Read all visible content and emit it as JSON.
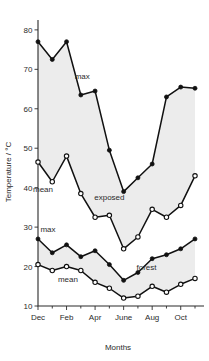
{
  "chart_data": {
    "type": "line",
    "title": "",
    "xlabel": "Months",
    "ylabel": "Temperature / °C",
    "ylim": [
      10,
      82
    ],
    "yticks": [
      10,
      20,
      30,
      40,
      50,
      60,
      70,
      80
    ],
    "ytick_labels": [
      "10",
      "20",
      "30",
      "40",
      "50",
      "60",
      "70",
      "80"
    ],
    "x": [
      "Dec",
      "Jan",
      "Feb",
      "Mar",
      "Apr",
      "May",
      "June",
      "July",
      "Aug",
      "Sep",
      "Oct",
      "Nov"
    ],
    "xticks": [
      "Dec",
      "Feb",
      "Apr",
      "June",
      "Aug",
      "Oct"
    ],
    "xtick_labels": [
      "Dec",
      "Feb",
      "Apr",
      "June",
      "Aug",
      "Oct"
    ],
    "grid": false,
    "legend_position": "inline-annotations",
    "annotations": [
      {
        "text": "max",
        "series": "exposed_max",
        "x": 3.1,
        "y": 67.5
      },
      {
        "text": "mean",
        "series": "exposed_mean",
        "x": 0.35,
        "y": 39.0
      },
      {
        "text": "exposed",
        "series": "exposed_band",
        "x": 5.0,
        "y": 37.0
      },
      {
        "text": "max",
        "series": "forest_max",
        "x": 0.7,
        "y": 28.8
      },
      {
        "text": "mean",
        "series": "forest_mean",
        "x": 2.1,
        "y": 16.0
      },
      {
        "text": "forest",
        "series": "forest_band",
        "x": 7.6,
        "y": 19.2
      }
    ],
    "series": [
      {
        "name": "exposed_max",
        "marker": "filled-circle",
        "values": [
          77.0,
          72.5,
          77.0,
          63.5,
          64.5,
          49.5,
          39.0,
          42.5,
          46.0,
          63.0,
          65.5,
          65.2
        ]
      },
      {
        "name": "exposed_mean",
        "marker": "open-circle",
        "values": [
          46.5,
          41.5,
          48.0,
          38.5,
          32.5,
          33.0,
          24.5,
          27.5,
          34.5,
          32.5,
          35.5,
          43.0
        ]
      },
      {
        "name": "forest_max",
        "marker": "filled-circle",
        "values": [
          27.0,
          23.5,
          25.5,
          22.5,
          24.0,
          20.5,
          16.5,
          18.5,
          22.0,
          23.0,
          24.5,
          27.0
        ]
      },
      {
        "name": "forest_mean",
        "marker": "open-circle",
        "values": [
          20.5,
          19.0,
          20.0,
          19.0,
          16.0,
          14.5,
          12.0,
          12.5,
          15.0,
          13.5,
          15.5,
          17.0
        ]
      }
    ]
  },
  "figure": {
    "ylabel": "Temperature / °C",
    "xlabel": "Months"
  }
}
